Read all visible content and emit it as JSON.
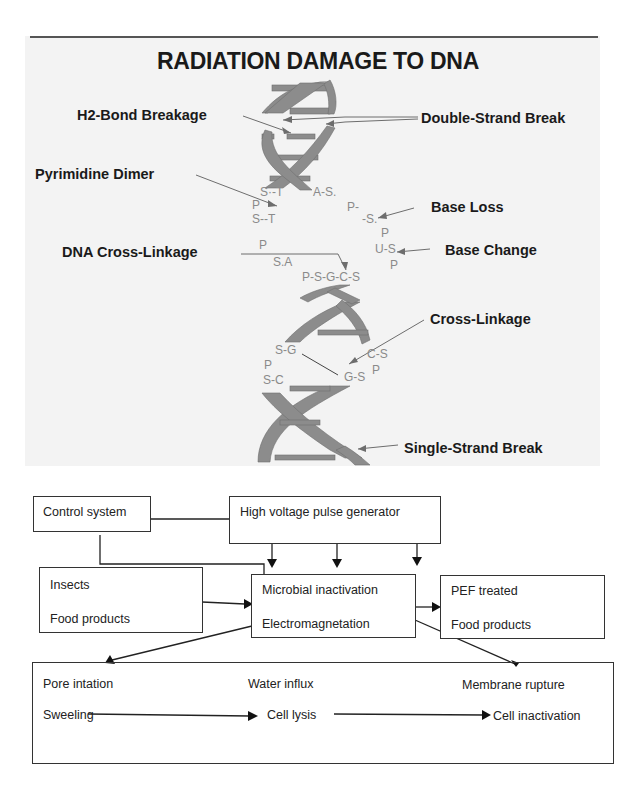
{
  "dna_figure": {
    "title": "RADIATION DAMAGE TO DNA",
    "labels": {
      "h2_bond_breakage": "H2-Bond Breakage",
      "double_strand_break": "Double-Strand Break",
      "pyrimidine_dimer": "Pyrimidine Dimer",
      "base_loss": "Base Loss",
      "dna_cross_linkage": "DNA Cross-Linkage",
      "base_change": "Base Change",
      "cross_linkage": "Cross-Linkage",
      "single_strand_break": "Single-Strand Break"
    },
    "bases": {
      "s_t_1": "S·-T",
      "a_s": "A-S.",
      "p_1": "P",
      "p_right_1": "P-",
      "s_t_2": "S--T",
      "s_right": "-S.",
      "p_right_2": "P",
      "p_2": "P",
      "u_s": "U-S",
      "s_a": "S.A",
      "p_right_3": "P",
      "psgcs": "P-S-G-C-S",
      "s_g": "S-G",
      "c_s": "C-S",
      "p_3": "P",
      "g_s": "G-S",
      "p_right_4": "P",
      "s_c": "S-C"
    },
    "colors": {
      "strand": "#8c8c8c",
      "base_text": "#8a8a8a",
      "label_text": "#1a1a1a",
      "panel_bg": "#f3f3f3"
    }
  },
  "flow_diagram": {
    "boxes": {
      "control_system": "Control system",
      "pulse_generator": "High voltage pulse generator",
      "input_line1": "Insects",
      "input_line2": "Food products",
      "center_line1": "Microbial inactivation",
      "center_line2": "Electromagnetation",
      "output_line1": "PEF treated",
      "output_line2": "Food products"
    },
    "effects": {
      "pore": "Pore intation",
      "water": "Water influx",
      "membrane": "Membrane rupture",
      "sweeling": "Sweeling",
      "lysis": "Cell lysis",
      "inactivation": "Cell inactivation"
    }
  }
}
